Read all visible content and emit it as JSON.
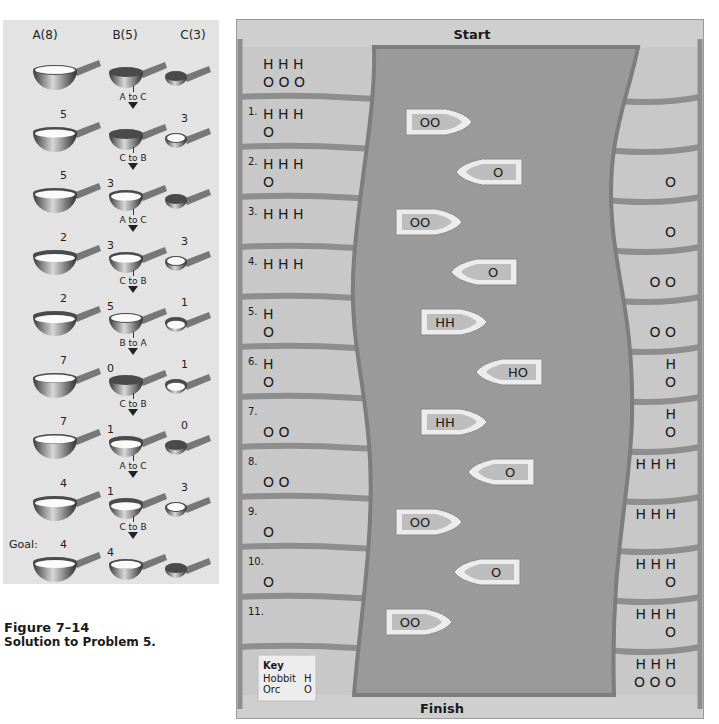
{
  "figure": {
    "label": "Figure 7–14",
    "caption": "Solution to Problem 5."
  },
  "cups": {
    "headers": [
      "A(8)",
      "B(5)",
      "C(3)"
    ],
    "goal_label": "Goal:",
    "rows": [
      {
        "a": "",
        "b": "",
        "c": "",
        "a_fill": 8,
        "b_fill": 0,
        "c_fill": 0,
        "move": ""
      },
      {
        "a": "5",
        "b": "",
        "c": "3",
        "a_fill": 5,
        "b_fill": 0,
        "c_fill": 3,
        "move": "A to C"
      },
      {
        "a": "5",
        "b": "3",
        "c": "",
        "a_fill": 5,
        "b_fill": 3,
        "c_fill": 0,
        "move": "C to B"
      },
      {
        "a": "2",
        "b": "3",
        "c": "3",
        "a_fill": 2,
        "b_fill": 3,
        "c_fill": 3,
        "move": "A to C"
      },
      {
        "a": "2",
        "b": "5",
        "c": "1",
        "a_fill": 2,
        "b_fill": 5,
        "c_fill": 1,
        "move": "C to B"
      },
      {
        "a": "7",
        "b": "0",
        "c": "1",
        "a_fill": 7,
        "b_fill": 0,
        "c_fill": 1,
        "move": "B to A"
      },
      {
        "a": "7",
        "b": "1",
        "c": "0",
        "a_fill": 7,
        "b_fill": 1,
        "c_fill": 0,
        "move": "C to B"
      },
      {
        "a": "4",
        "b": "1",
        "c": "3",
        "a_fill": 4,
        "b_fill": 1,
        "c_fill": 3,
        "move": "A to C"
      },
      {
        "a": "4",
        "b": "4",
        "c": "",
        "a_fill": 4,
        "b_fill": 4,
        "c_fill": 0,
        "move": "C to B"
      }
    ]
  },
  "river": {
    "start_label": "Start",
    "finish_label": "Finish",
    "key": {
      "title": "Key",
      "hobbit_label": "Hobbit",
      "hobbit_symbol": "H",
      "orc_label": "Orc",
      "orc_symbol": "O"
    },
    "rows": [
      {
        "step": "",
        "left": [
          "H H H",
          "O O O"
        ],
        "right": [
          "",
          ""
        ],
        "boat": "",
        "boat_dir": ""
      },
      {
        "step": "1.",
        "left": [
          "H H H",
          "O"
        ],
        "right": [
          "",
          ""
        ],
        "boat": "OO",
        "boat_dir": "right"
      },
      {
        "step": "2.",
        "left": [
          "H H H",
          "O"
        ],
        "right": [
          "",
          "O"
        ],
        "boat": "O",
        "boat_dir": "left"
      },
      {
        "step": "3.",
        "left": [
          "H H H",
          ""
        ],
        "right": [
          "",
          "O"
        ],
        "boat": "OO",
        "boat_dir": "right"
      },
      {
        "step": "4.",
        "left": [
          "H H H",
          ""
        ],
        "right": [
          "",
          "O O"
        ],
        "boat": "O",
        "boat_dir": "left"
      },
      {
        "step": "5.",
        "left": [
          "H",
          "O"
        ],
        "right": [
          "",
          "O O"
        ],
        "boat": "HH",
        "boat_dir": "right"
      },
      {
        "step": "6.",
        "left": [
          "H",
          "O"
        ],
        "right": [
          "H",
          "O"
        ],
        "boat": "HO",
        "boat_dir": "left"
      },
      {
        "step": "7.",
        "left": [
          "",
          "O O"
        ],
        "right": [
          "H",
          "O"
        ],
        "boat": "HH",
        "boat_dir": "right"
      },
      {
        "step": "8.",
        "left": [
          "",
          "O O"
        ],
        "right": [
          "H H H",
          ""
        ],
        "boat": "O",
        "boat_dir": "left"
      },
      {
        "step": "9.",
        "left": [
          "",
          "O"
        ],
        "right": [
          "H H H",
          ""
        ],
        "boat": "OO",
        "boat_dir": "right"
      },
      {
        "step": "10.",
        "left": [
          "",
          "O"
        ],
        "right": [
          "H H H",
          "O"
        ],
        "boat": "O",
        "boat_dir": "left"
      },
      {
        "step": "11.",
        "left": [
          "",
          ""
        ],
        "right": [
          "H H H",
          "O"
        ],
        "boat": "OO",
        "boat_dir": "right"
      },
      {
        "step": "",
        "left": [
          "",
          ""
        ],
        "right": [
          "H H H",
          "O O O"
        ],
        "boat": "",
        "boat_dir": ""
      }
    ]
  },
  "colors": {
    "panel_bg": "#e3e3e3",
    "bank": "#c8c8c8",
    "bank_gap": "#8e8e8e",
    "river": "#9a9a9a",
    "river_edge": "#7d7d7d",
    "boat_hull": "#ececec",
    "boat_deck": "#bdbdbd"
  }
}
